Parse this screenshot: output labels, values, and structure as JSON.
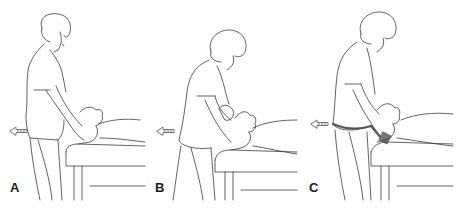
{
  "figure": {
    "line_color": "#3a3a3a",
    "arrow_color": "#555555",
    "panels": [
      {
        "label": "A",
        "arrow_direction": "left",
        "technique": "hands under occiput"
      },
      {
        "label": "B",
        "arrow_direction": "left",
        "technique": "cradled head with forearms"
      },
      {
        "label": "C",
        "arrow_direction": "left",
        "technique": "traction belt around therapist's hips"
      }
    ]
  }
}
